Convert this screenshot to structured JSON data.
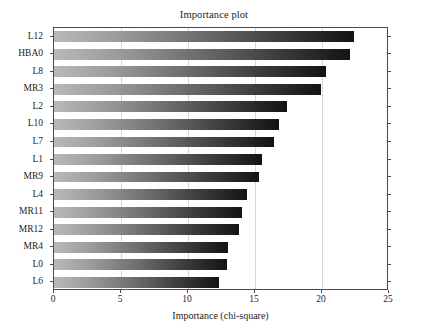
{
  "chart_data": {
    "type": "bar",
    "orientation": "horizontal",
    "title": "Importance plot",
    "xlabel": "Importance (chi-square)",
    "ylabel": "",
    "xlim": [
      0,
      25
    ],
    "xticks": [
      0,
      5,
      10,
      15,
      20,
      25
    ],
    "xtick_labels": [
      "0",
      "5",
      "10",
      "15",
      "20",
      "25"
    ],
    "grid": "vertical-only",
    "legend": "none",
    "categories": [
      "L12",
      "HBA0",
      "L8",
      "MR3",
      "L2",
      "L10",
      "L7",
      "L1",
      "MR9",
      "L4",
      "MR11",
      "MR12",
      "MR4",
      "L0",
      "L6"
    ],
    "values": [
      22.4,
      22.1,
      20.3,
      19.9,
      17.4,
      16.8,
      16.4,
      15.5,
      15.3,
      14.4,
      14.0,
      13.8,
      13.0,
      12.9,
      12.3
    ],
    "series": [
      {
        "name": "Importance (chi-square)",
        "values": [
          22.4,
          22.1,
          20.3,
          19.9,
          17.4,
          16.8,
          16.4,
          15.5,
          15.3,
          14.4,
          14.0,
          13.8,
          13.0,
          12.9,
          12.3
        ]
      }
    ],
    "bar_fill": "horizontal gradient light-gray to black",
    "colors": {
      "bar_gradient_start": "#b9b9b9",
      "bar_gradient_end": "#131313",
      "axis": "#4a4a4a",
      "gridline": "#d6d6d6",
      "background": "#ffffff",
      "text": "#1c1c1c"
    }
  }
}
